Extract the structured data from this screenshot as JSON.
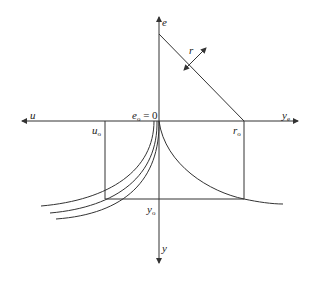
{
  "diagram": {
    "labels": {
      "e_axis": "e",
      "u_axis": "u",
      "y_e_axis": "y",
      "y_e_sub": "e",
      "y_axis": "y",
      "origin": "e",
      "origin_sub": "o",
      "origin_eq": " = 0",
      "u0": "u",
      "u0_sub": "o",
      "r0": "r",
      "r0_sub": "o",
      "y0": "y",
      "y0_sub": "o",
      "r": "r"
    },
    "colors": {
      "line": "#333333",
      "text": "#222222"
    }
  }
}
